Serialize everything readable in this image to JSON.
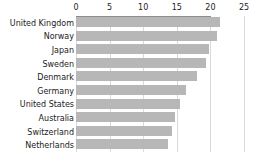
{
  "chart_data": {
    "type": "bar",
    "orientation": "horizontal",
    "title": "",
    "subtitle": "",
    "xlabel": "",
    "ylabel": "",
    "xlim": [
      0,
      25
    ],
    "grid": true,
    "legend": false,
    "legend_position": "none",
    "bar_color": "#b7b7b7",
    "axis_color": "#8c8c8c",
    "grid_color": "#d9d9d9",
    "text_color": "#1a1a1a",
    "xticks": [
      0,
      5,
      10,
      15,
      20,
      25
    ],
    "xtick_labels": [
      "0",
      "5",
      "10",
      "15",
      "20",
      "25"
    ],
    "categories": [
      "United Kingdom",
      "Norway",
      "Japan",
      "Sweden",
      "Denmark",
      "Germany",
      "United States",
      "Australia",
      "Switzerland",
      "Netherlands"
    ],
    "values": [
      21.5,
      21.0,
      19.8,
      19.3,
      18.0,
      16.3,
      15.5,
      14.8,
      14.3,
      13.7
    ]
  }
}
